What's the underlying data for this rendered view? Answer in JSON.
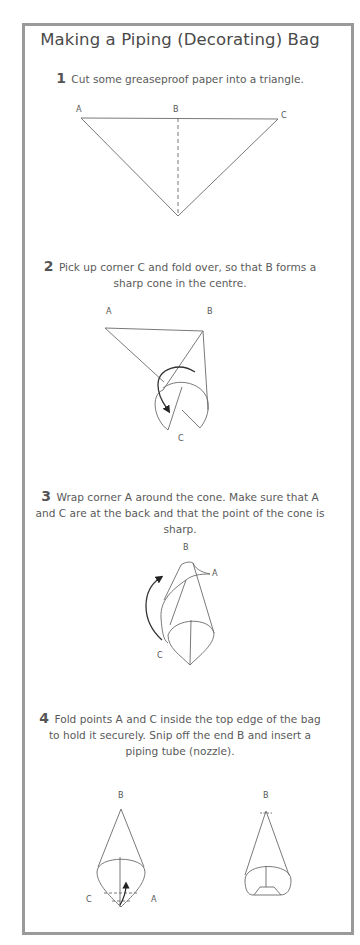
{
  "title": "Making a Piping (Decorating) Bag",
  "steps": [
    {
      "number": "1",
      "text": "Cut some greaseproof paper into a triangle.",
      "labels": {
        "a": "A",
        "b": "B",
        "c": "C"
      }
    },
    {
      "number": "2",
      "text": "Pick up corner C and fold over, so that B forms a sharp cone in the centre.",
      "labels": {
        "a": "A",
        "b": "B",
        "c": "C"
      }
    },
    {
      "number": "3",
      "text": "Wrap corner A around the cone. Make sure that A and C are at the back and that the point of the cone is sharp.",
      "labels": {
        "a": "A",
        "b": "B",
        "c": "C"
      }
    },
    {
      "number": "4",
      "text": "Fold points A and C inside the top edge of the bag to hold it securely. Snip off the end B and insert a piping tube (nozzle).",
      "labels": {
        "a": "A",
        "b": "B",
        "c": "C",
        "b2": "B"
      }
    }
  ],
  "colors": {
    "frame": "#9a9a9a",
    "line": "#6a6a6a",
    "text": "#555555"
  }
}
